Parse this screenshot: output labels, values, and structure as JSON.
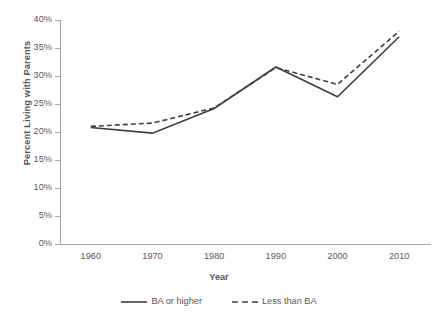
{
  "chart_data": {
    "type": "line",
    "title": "",
    "xlabel": "Year",
    "ylabel": "Percent Living with Parents",
    "categories": [
      1960,
      1970,
      1980,
      1990,
      2000,
      2010
    ],
    "x_tick_labels": [
      "1960",
      "1970",
      "1980",
      "1990",
      "2000",
      "2010"
    ],
    "y_tick_labels": [
      "0%",
      "5%",
      "10%",
      "15%",
      "20%",
      "25%",
      "30%",
      "35%",
      "40%"
    ],
    "y_tick_values": [
      0,
      5,
      10,
      15,
      20,
      25,
      30,
      35,
      40
    ],
    "ylim": [
      0,
      40
    ],
    "xlim": [
      1960,
      2010
    ],
    "grid": false,
    "legend_position": "bottom",
    "series": [
      {
        "name": "BA or higher",
        "style": "solid",
        "color": "#3f3f3f",
        "values": [
          20.8,
          19.8,
          24.2,
          31.6,
          26.3,
          37.0
        ]
      },
      {
        "name": "Less than BA",
        "style": "dashed",
        "color": "#3f3f3f",
        "values": [
          21.0,
          21.6,
          24.3,
          31.5,
          28.5,
          38.0
        ]
      }
    ]
  },
  "axis": {
    "y_title": "Percent Living with Parents",
    "x_title": "Year"
  },
  "legend": {
    "items": [
      {
        "label": "BA or higher",
        "swatch": "solid-line-icon"
      },
      {
        "label": "Less than BA",
        "swatch": "dashed-line-icon"
      }
    ]
  },
  "colors": {
    "line": "#3f3f3f",
    "axis": "#a6a6a6",
    "text": "#5a5a5a",
    "background": "#ffffff"
  }
}
